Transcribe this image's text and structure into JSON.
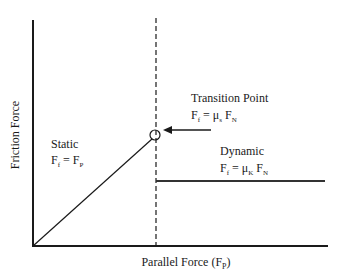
{
  "diagram": {
    "title": "",
    "y_axis_label": "Friction Force",
    "x_axis_label": {
      "main": "Parallel Force (F",
      "sub": "P",
      "close": ")"
    },
    "static_region": {
      "label": "Static",
      "equation": {
        "lhs": "F",
        "lhs_sub": "f",
        "eq": " = ",
        "rhs": "F",
        "rhs_sub": "P"
      }
    },
    "transition_point": {
      "label": "Transition Point",
      "equation": {
        "lhs": "F",
        "lhs_sub": "f",
        "eq": " = ",
        "coef": "μ",
        "coef_sub": "s",
        "rhs": " F",
        "rhs_sub": "N"
      }
    },
    "dynamic_region": {
      "label": "Dynamic",
      "equation": {
        "lhs": "F",
        "lhs_sub": "f",
        "eq": " = ",
        "coef": "μ",
        "coef_sub": "K",
        "rhs": " F",
        "rhs_sub": "N"
      }
    },
    "colors": {
      "line": "#1a1a1a",
      "dynamic_line": "#333333"
    }
  }
}
